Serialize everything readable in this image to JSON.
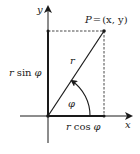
{
  "diagram": {
    "axes": {
      "x_label": "x",
      "y_label": "y"
    },
    "point": {
      "label": "P = (x, y)",
      "label_parts": {
        "name": "P",
        "eq": "=",
        "coords": "(x, y)"
      }
    },
    "radius_label": "r",
    "angle_label": "φ",
    "horizontal_leg_label": {
      "r": "r",
      "fn": "cos",
      "angle": "φ"
    },
    "vertical_leg_label": {
      "r": "r",
      "fn": "sin",
      "angle": "φ"
    },
    "colors": {
      "line": "#1a1a1a",
      "dash": "#333333",
      "background": "#ffffff"
    }
  }
}
